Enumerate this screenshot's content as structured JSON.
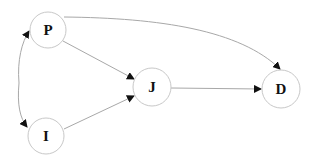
{
  "diagram": {
    "type": "directed-graph",
    "nodes": [
      {
        "id": "P",
        "label": "P",
        "x": 48,
        "y": 30
      },
      {
        "id": "J",
        "label": "J",
        "x": 152,
        "y": 87
      },
      {
        "id": "I",
        "label": "I",
        "x": 46,
        "y": 136
      },
      {
        "id": "D",
        "label": "D",
        "x": 281,
        "y": 89
      }
    ],
    "edges": [
      {
        "from": "P",
        "to": "J"
      },
      {
        "from": "I",
        "to": "J"
      },
      {
        "from": "J",
        "to": "D"
      },
      {
        "from": "P",
        "to": "D",
        "curved": true
      },
      {
        "from": "P",
        "to": "I",
        "curved": true,
        "bidirectional": true
      }
    ]
  },
  "labels": {
    "P": "P",
    "J": "J",
    "I": "I",
    "D": "D"
  }
}
